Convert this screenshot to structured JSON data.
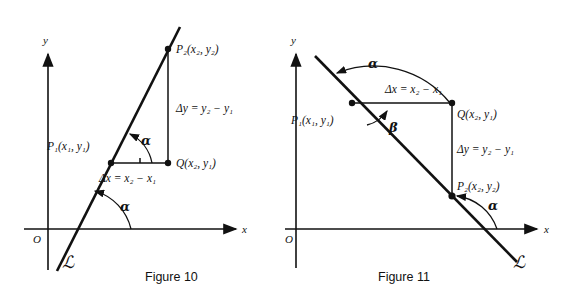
{
  "page": {
    "background": "#ffffff",
    "ink_color": "#111111",
    "width": 570,
    "height": 297
  },
  "figures": [
    {
      "id": "figure-10",
      "caption": "Figure 10",
      "slope_sign": "positive",
      "axes": {
        "x_label": "x",
        "y_label": "y",
        "origin_label": "O"
      },
      "line_label": "ℒ",
      "points": [
        {
          "name": "P1",
          "label": "P",
          "sub": "1",
          "coords": "(x₁, y₁)",
          "full": "P₁(x₁, y₁)"
        },
        {
          "name": "P2",
          "label": "P",
          "sub": "2",
          "coords": "(x₂, y₂)",
          "full": "P₂(x₂, y₂)"
        },
        {
          "name": "Q",
          "label": "Q",
          "sub": "",
          "coords": "(x₂, y₁)",
          "full": "Q(x₂, y₁)"
        }
      ],
      "annotations": {
        "delta_x": "Δx = x₂ − x₁",
        "delta_y": "Δy = y₂ − y₁",
        "angle_at_p1": "α",
        "angle_at_axis": "α"
      }
    },
    {
      "id": "figure-11",
      "caption": "Figure 11",
      "slope_sign": "negative",
      "axes": {
        "x_label": "x",
        "y_label": "y",
        "origin_label": "O"
      },
      "line_label": "ℒ",
      "points": [
        {
          "name": "P1",
          "label": "P",
          "sub": "1",
          "coords": "(x₁, y₁)",
          "full": "P₁(x₁, y₁)"
        },
        {
          "name": "P2",
          "label": "P",
          "sub": "2",
          "coords": "(x₂, y₂)",
          "full": "P₂(x₂, y₂)"
        },
        {
          "name": "Q",
          "label": "Q",
          "sub": "",
          "coords": "(x₂, y₁)",
          "full": "Q(x₂, y₁)"
        }
      ],
      "annotations": {
        "delta_x": "Δx = x₂ − x₁",
        "delta_y": "Δy = y₂ − y₁",
        "angle_at_p1_obtuse": "α",
        "angle_beta": "β",
        "angle_at_axis": "α"
      }
    }
  ]
}
